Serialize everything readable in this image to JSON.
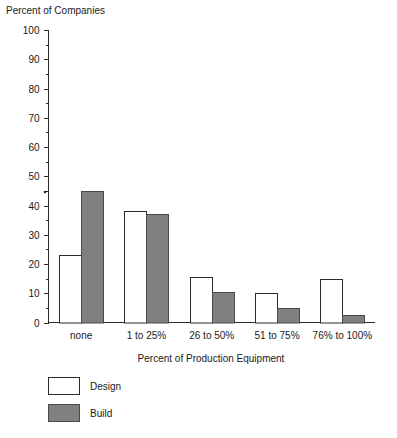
{
  "chart_data": {
    "type": "bar",
    "title": "Percent of Companies",
    "xlabel": "Percent of Production Equipment",
    "ylabel": "Percent of Companies",
    "categories": [
      "none",
      "1 to 25%",
      "26 to 50%",
      "51 to 75%",
      "76% to 100%"
    ],
    "series": [
      {
        "name": "Design",
        "values": [
          23,
          38,
          15.5,
          10,
          15
        ],
        "color": "#ffffff"
      },
      {
        "name": "Build",
        "values": [
          45,
          37,
          10.5,
          5,
          2.5
        ],
        "color": "#808080"
      }
    ],
    "ylim": [
      0,
      100
    ],
    "ytick_step": 10,
    "ytick_labels": [
      "0",
      "10",
      "20",
      "30",
      "40",
      "50",
      "60",
      "70",
      "80",
      "90",
      "100"
    ],
    "minor_ticks": true,
    "grid": false,
    "legend_position": "bottom-left"
  },
  "legend": {
    "entries": [
      {
        "label": "Design"
      },
      {
        "label": "Build"
      }
    ]
  },
  "colors": {
    "axis": "#2b2b2b",
    "text": "#1a1a1a",
    "design_fill": "#ffffff",
    "build_fill": "#808080",
    "background": "#ffffff"
  }
}
